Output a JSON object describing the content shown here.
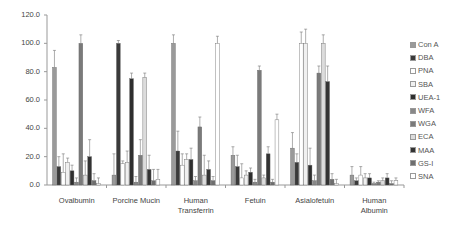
{
  "chart_data": {
    "type": "bar",
    "title": "",
    "xlabel": "",
    "ylabel": "",
    "ylim": [
      0,
      120
    ],
    "yticks": [
      "0.0",
      "20.0",
      "40.0",
      "60.0",
      "80.0",
      "100.0",
      "120.0"
    ],
    "grid": false,
    "legend_position": "right",
    "categories": [
      "Ovalbumin",
      "Porcine Mucin",
      "Human Transferrin",
      "Fetuin",
      "Asialofetuin",
      "Human Albumin"
    ],
    "category_labels": [
      [
        "Ovalbumin"
      ],
      [
        "Porcine Mucin"
      ],
      [
        "Human",
        "Transferrin"
      ],
      [
        "Fetuin"
      ],
      [
        "Asialofetuin"
      ],
      [
        "Human",
        "Albumin"
      ]
    ],
    "series": [
      {
        "name": "Con A",
        "color": "#9a9a9a",
        "values": [
          83,
          7,
          100,
          21,
          26,
          7
        ],
        "errors": [
          12,
          15,
          6,
          6,
          11,
          6
        ]
      },
      {
        "name": "DBA",
        "color": "#3a3a3a",
        "values": [
          13,
          100,
          24,
          13,
          16,
          3
        ],
        "errors": [
          7,
          2,
          14,
          8,
          6,
          2
        ]
      },
      {
        "name": "PNA",
        "color": "#ffffff",
        "values": [
          9,
          15,
          14,
          5,
          100,
          7
        ],
        "errors": [
          13,
          2,
          8,
          10,
          8,
          6
        ]
      },
      {
        "name": "SBA",
        "color": "#f0f0f0",
        "values": [
          16,
          16,
          18,
          7,
          100,
          5
        ],
        "errors": [
          3,
          8,
          4,
          3,
          10,
          3
        ]
      },
      {
        "name": "UEA-1",
        "color": "#2e2e2e",
        "values": [
          10,
          75,
          18,
          9,
          14,
          5
        ],
        "errors": [
          4,
          4,
          8,
          3,
          12,
          3
        ]
      },
      {
        "name": "WFA",
        "color": "#888888",
        "values": [
          2,
          2,
          3,
          2,
          3,
          1
        ],
        "errors": [
          3,
          4,
          3,
          2,
          4,
          1
        ]
      },
      {
        "name": "WGA",
        "color": "#7a7a7a",
        "values": [
          100,
          21,
          41,
          81,
          79,
          2
        ],
        "errors": [
          6,
          11,
          7,
          3,
          5,
          1
        ]
      },
      {
        "name": "ECA",
        "color": "#dcdcdc",
        "values": [
          7,
          76,
          7,
          5,
          100,
          3
        ],
        "errors": [
          10,
          3,
          14,
          2,
          6,
          2
        ]
      },
      {
        "name": "MAA",
        "color": "#333333",
        "values": [
          20,
          11,
          11,
          22,
          73,
          5
        ],
        "errors": [
          12,
          10,
          6,
          5,
          11,
          3
        ]
      },
      {
        "name": "GS-I",
        "color": "#6e6e6e",
        "values": [
          3,
          3,
          3,
          2,
          4,
          1
        ],
        "errors": [
          5,
          8,
          3,
          2,
          4,
          2
        ]
      },
      {
        "name": "SNA",
        "color": "#ffffff",
        "values": [
          1,
          4,
          100,
          46,
          1,
          3
        ],
        "errors": [
          4,
          7,
          5,
          4,
          3,
          2
        ]
      }
    ]
  }
}
